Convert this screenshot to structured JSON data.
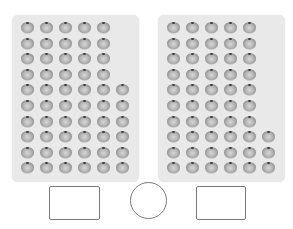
{
  "scene": {
    "description": "Two trays of beads to count and compare; answer boxes below",
    "colors": {
      "tray": "#e9e9e9",
      "bead_light": "#d8d8d8",
      "bead_dark": "#5e5e5e",
      "outline": "#7a7a7a"
    }
  },
  "panels": [
    {
      "name": "left-tray",
      "rows": 10,
      "full_columns": 5,
      "extra_column_rows": 6,
      "extra_column_position": "bottom",
      "total": 56
    },
    {
      "name": "right-tray",
      "rows": 10,
      "full_columns": 5,
      "extra_column_rows": 3,
      "extra_column_position": "bottom",
      "total": 53
    }
  ],
  "answers": {
    "left_box": "",
    "compare_symbol": "",
    "right_box": ""
  }
}
